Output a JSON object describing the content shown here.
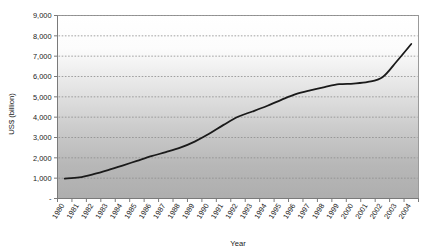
{
  "chart_data": {
    "type": "line",
    "title": "",
    "xlabel": "Year",
    "ylabel": "US$ (billion)",
    "xlim": [
      1980,
      2004
    ],
    "ylim": [
      0,
      9000
    ],
    "grid": true,
    "legend": false,
    "legend_position": "none",
    "y_ticks": [
      0,
      1000,
      2000,
      3000,
      4000,
      5000,
      6000,
      7000,
      8000,
      9000
    ],
    "y_tick_labels": [
      "-",
      "1,000",
      "2,000",
      "3,000",
      "4,000",
      "5,000",
      "6,000",
      "7,000",
      "8,000",
      "9,000"
    ],
    "categories": [
      "1980",
      "1981",
      "1982",
      "1983",
      "1984",
      "1985",
      "1986",
      "1987",
      "1988",
      "1989",
      "1990",
      "1991",
      "1992",
      "1993",
      "1994",
      "1995",
      "1996",
      "1997",
      "1998",
      "1999",
      "2000",
      "2001",
      "2002",
      "2003",
      "2004"
    ],
    "x": [
      1980,
      1981,
      1982,
      1983,
      1984,
      1985,
      1986,
      1987,
      1988,
      1989,
      1990,
      1991,
      1992,
      1993,
      1994,
      1995,
      1996,
      1997,
      1998,
      1999,
      2000,
      2001,
      2002,
      2003,
      2004
    ],
    "values": [
      980,
      1040,
      1200,
      1400,
      1620,
      1850,
      2080,
      2280,
      2500,
      2800,
      3180,
      3620,
      4020,
      4280,
      4550,
      4850,
      5130,
      5320,
      5480,
      5620,
      5650,
      5730,
      5960,
      6750,
      7600
    ],
    "series": [
      {
        "name": "US$ (billion)",
        "color": "#1a1a1a",
        "values": [
          980,
          1040,
          1200,
          1400,
          1620,
          1850,
          2080,
          2280,
          2500,
          2800,
          3180,
          3620,
          4020,
          4280,
          4550,
          4850,
          5130,
          5320,
          5480,
          5620,
          5650,
          5730,
          5960,
          6750,
          7600
        ]
      }
    ],
    "annotations": []
  },
  "style": {
    "plot_bg_top": "#ffffff",
    "plot_bg_bottom": "#aeaeae",
    "gridline_color": "#8c8c8c",
    "axis_color": "#7a7a7a",
    "line_color": "#1a1a1a",
    "text_color": "#1a1a1a",
    "page_bg": "#ffffff"
  }
}
